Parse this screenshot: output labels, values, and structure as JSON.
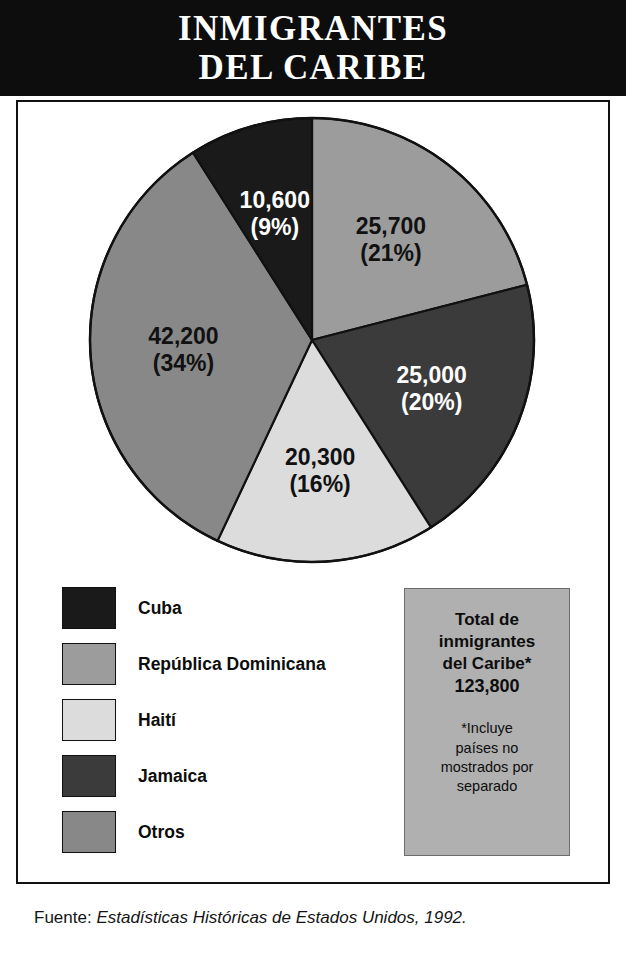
{
  "title": "INMIGRANTES\nDEL CARIBE",
  "chart_data": {
    "type": "pie",
    "title": "INMIGRANTES DEL CARIBE",
    "categories": [
      "Cuba",
      "República Dominicana",
      "Haití",
      "Jamaica",
      "Otros"
    ],
    "values": [
      10600,
      25700,
      20300,
      25000,
      42200
    ],
    "percentages": [
      9,
      21,
      16,
      20,
      34
    ],
    "value_labels": [
      "10,600",
      "25,700",
      "20,300",
      "25,000",
      "42,200"
    ],
    "percent_labels": [
      "(9%)",
      "(21%)",
      "(16%)",
      "(20%)",
      "(34%)"
    ],
    "colors": [
      "#1a1a1a",
      "#9c9c9c",
      "#dcdcdc",
      "#3b3b3b",
      "#888888"
    ],
    "label_text_colors": [
      "#ffffff",
      "#111111",
      "#111111",
      "#ffffff",
      "#111111"
    ],
    "total": 123800,
    "total_label": "123,800",
    "legend_position": "bottom-left",
    "start_angle_deg": 0,
    "direction": "clockwise",
    "slice_order": [
      "República Dominicana",
      "Jamaica",
      "Haití",
      "Otros",
      "Cuba"
    ]
  },
  "legend": {
    "items": [
      {
        "label": "Cuba",
        "color": "#1a1a1a"
      },
      {
        "label": "República Dominicana",
        "color": "#9c9c9c"
      },
      {
        "label": "Haití",
        "color": "#dcdcdc"
      },
      {
        "label": "Jamaica",
        "color": "#3b3b3b"
      },
      {
        "label": "Otros",
        "color": "#888888"
      }
    ]
  },
  "total_box": {
    "heading": "Total de\ninmigrantes\ndel Caribe*",
    "value": "123,800",
    "note": "*Incluye\npaíses no\nmostrados por\nseparado",
    "background": "#b0b0b0"
  },
  "source": {
    "prefix": "Fuente: ",
    "title": "Estadísticas Históricas de Estados Unidos, 1992."
  }
}
